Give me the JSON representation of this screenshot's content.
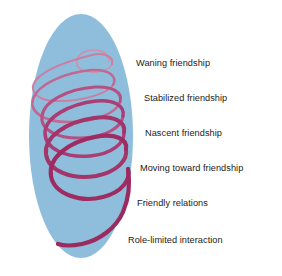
{
  "figure": {
    "type": "concept-diagram",
    "background_color": "#ffffff",
    "ellipse": {
      "name": "blue-ellipse",
      "fill_color": "#8fbedd",
      "center_x": 81,
      "center_y": 136,
      "radius_x": 52,
      "radius_y": 122
    },
    "spiral": {
      "name": "friendship-spiral",
      "color_top": "#cf87a8",
      "color_bottom": "#a02e63",
      "stroke_width_top": 1.5,
      "stroke_width_bottom": 4.2,
      "turns": 6,
      "direction": "widening-downward"
    }
  },
  "stages": [
    {
      "id": "waning-friendship",
      "label": "Waning friendship",
      "x": 136,
      "y": 58,
      "order": 1
    },
    {
      "id": "stabilized-friendship",
      "label": "Stabilized friendship",
      "x": 144,
      "y": 93,
      "order": 2
    },
    {
      "id": "nascent-friendship",
      "label": "Nascent friendship",
      "x": 145,
      "y": 128,
      "order": 3
    },
    {
      "id": "moving-toward-friendship",
      "label": "Moving toward friendship",
      "x": 140,
      "y": 163,
      "order": 4
    },
    {
      "id": "friendly-relations",
      "label": "Friendly relations",
      "x": 137,
      "y": 198,
      "order": 5
    },
    {
      "id": "role-limited-interaction",
      "label": "Role-limited interaction",
      "x": 128,
      "y": 235,
      "order": 6
    }
  ]
}
